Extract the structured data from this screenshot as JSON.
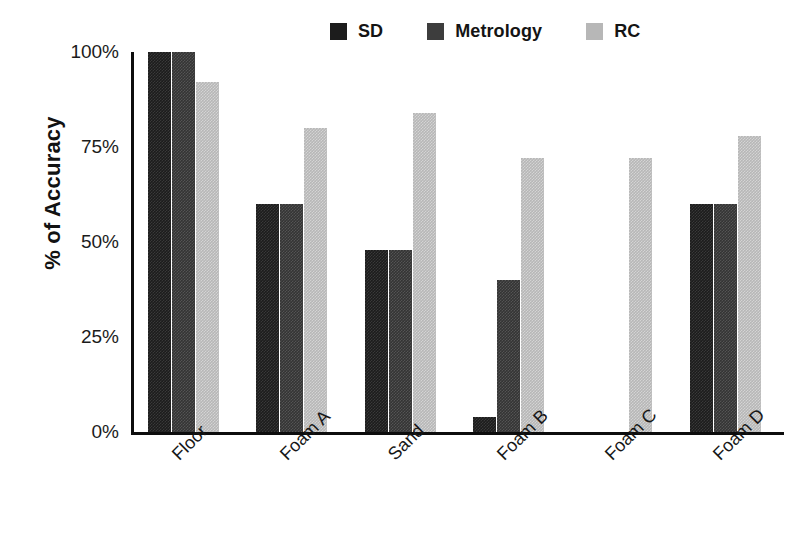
{
  "chart_data": {
    "type": "bar",
    "title": "",
    "xlabel": "",
    "ylabel": "% of Accuracy",
    "categories": [
      "Floor",
      "Foam A",
      "Sand",
      "Foam B",
      "Foam C",
      "Foam D"
    ],
    "series": [
      {
        "name": "SD",
        "color": "#1c1c1c",
        "values": [
          100,
          60,
          48,
          4,
          0,
          60
        ]
      },
      {
        "name": "Metrology",
        "color": "#3d3d3d",
        "values": [
          100,
          60,
          48,
          40,
          0,
          60
        ]
      },
      {
        "name": "RC",
        "color": "#b7b7b7",
        "values": [
          92,
          80,
          84,
          72,
          72,
          78
        ]
      }
    ],
    "ylim": [
      0,
      100
    ],
    "yticks": [
      0,
      25,
      50,
      75,
      100
    ],
    "ytick_labels": [
      "0%",
      "25%",
      "50%",
      "75%",
      "100%"
    ],
    "grid": false,
    "legend_position": "top-right",
    "xtick_rotation": -45
  },
  "legend": {
    "items": [
      {
        "label": "SD"
      },
      {
        "label": "Metrology"
      },
      {
        "label": "RC"
      }
    ]
  },
  "axes": {
    "y_title": "% of Accuracy"
  }
}
